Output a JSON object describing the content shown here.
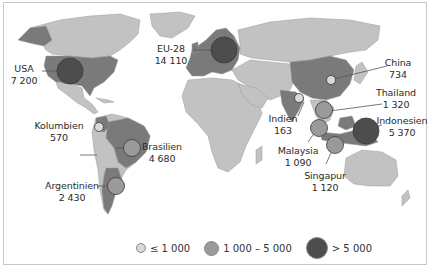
{
  "map": {
    "colors": {
      "water": "#ffffff",
      "land_default": "#c2c2c2",
      "land_highlight": "#7a7a7a",
      "border": "#9a9a9a",
      "circle_small": "#d9d9d9",
      "circle_medium": "#9a9a9a",
      "circle_large": "#4d4d4d",
      "circle_stroke": "#3a3a3a",
      "leader_line": "#555555"
    },
    "regions": [
      {
        "name": "USA",
        "value": "7 200",
        "category": "large"
      },
      {
        "name": "EU-28",
        "value": "14 110",
        "category": "large"
      },
      {
        "name": "China",
        "value": "734",
        "category": "small"
      },
      {
        "name": "Thailand",
        "value": "1 320",
        "category": "medium"
      },
      {
        "name": "Indonesien",
        "value": "5 370",
        "category": "large"
      },
      {
        "name": "Indien",
        "value": "163",
        "category": "small"
      },
      {
        "name": "Malaysia",
        "value": "1 090",
        "category": "medium"
      },
      {
        "name": "Singapur",
        "value": "1 120",
        "category": "medium"
      },
      {
        "name": "Kolumbien",
        "value": "570",
        "category": "small"
      },
      {
        "name": "Brasilien",
        "value": "4 680",
        "category": "medium"
      },
      {
        "name": "Argentinien",
        "value": "2 430",
        "category": "medium"
      }
    ],
    "legend": [
      {
        "label": "≤ 1 000",
        "category": "small"
      },
      {
        "label": "1 000 – 5 000",
        "category": "medium"
      },
      {
        "label": "> 5 000",
        "category": "large"
      }
    ]
  }
}
